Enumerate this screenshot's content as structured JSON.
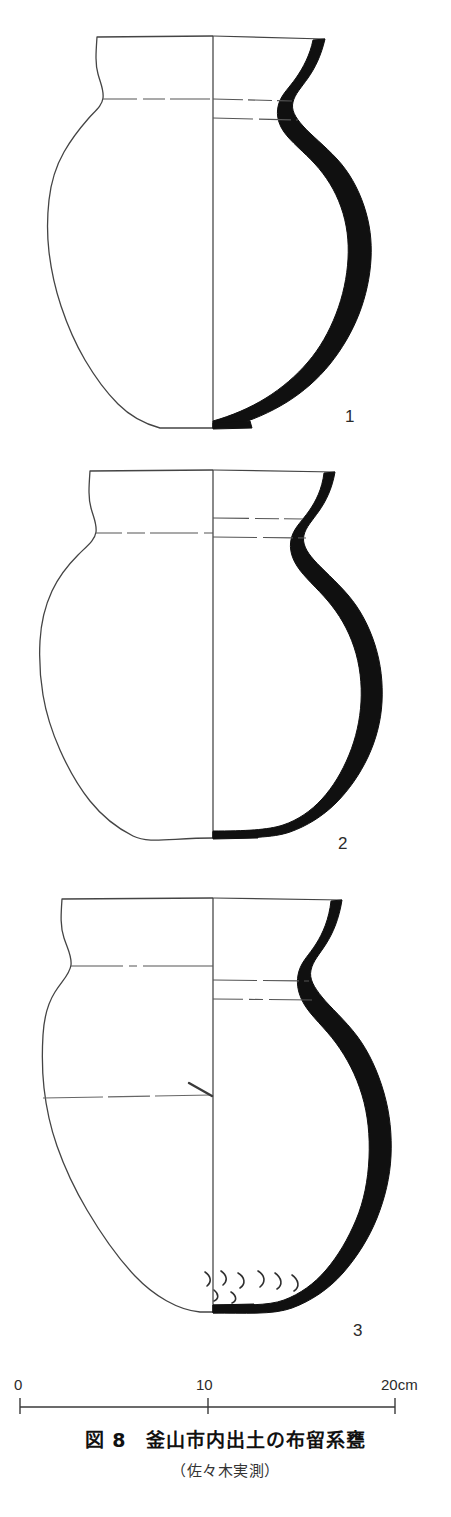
{
  "figure": {
    "caption_number": "図 8",
    "caption_title": "釜山市内出土の布留系甕",
    "caption_main": "図 8　釜山市内出土の布留系甕",
    "caption_sub": "（佐々木実測）",
    "background_color": "#ffffff",
    "ink_color": "#1a1a1a",
    "section_fill_color": "#111111",
    "thin_line_color": "#555555"
  },
  "scale_bar": {
    "unit": "cm",
    "ticks": [
      {
        "label": "0",
        "value": 0
      },
      {
        "label": "10",
        "value": 10
      },
      {
        "label": "20cm",
        "value": 20
      }
    ],
    "start_x": 20,
    "end_x": 395,
    "baseline_y": 1407
  },
  "vessels": [
    {
      "number": "1",
      "name": "furu-style-jar-1",
      "description": "布留系甕 第1号　口縁部外反・球形胴",
      "rim_y": 36,
      "base_y": 428,
      "max_width_y": 228,
      "left_edge_x": 48,
      "right_edge_x": 388,
      "center_x": 213,
      "neck_lines": 2
    },
    {
      "number": "2",
      "name": "furu-style-jar-2",
      "description": "布留系甕 第2号　口縁部外反・球形胴",
      "rim_y": 470,
      "base_y": 838,
      "max_width_y": 660,
      "left_edge_x": 40,
      "right_edge_x": 390,
      "center_x": 213,
      "neck_lines": 2
    },
    {
      "number": "3",
      "name": "furu-style-jar-3",
      "description": "布留系甕 第3号　口縁部外反・胴下部にハケ状工具痕",
      "rim_y": 898,
      "base_y": 1312,
      "max_width_y": 1120,
      "left_edge_x": 42,
      "right_edge_x": 392,
      "center_x": 213,
      "neck_lines": 2,
      "has_body_line": true,
      "has_tool_marks": true
    }
  ]
}
